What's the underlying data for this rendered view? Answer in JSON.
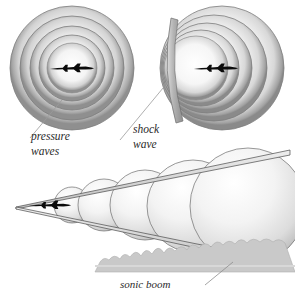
{
  "figure": {
    "background_color": "#ffffff",
    "width": 295,
    "height": 297
  },
  "labels": {
    "pressure_waves_line1": "pressure",
    "pressure_waves_line2": "waves",
    "shock_wave_line1": "shock",
    "shock_wave_line2": "wave",
    "sonic_boom": "sonic boom"
  },
  "panels": [
    {
      "name": "subsonic-panel",
      "description": "Concentric pressure wave rings around a jet",
      "center": {
        "x": 72,
        "y": 68
      },
      "ring_radii": [
        62,
        52,
        42,
        33,
        25
      ],
      "aircraft": {
        "x": 72,
        "y": 69,
        "length": 46,
        "color": "#0b0b0b"
      }
    },
    {
      "name": "sonic-panel",
      "description": "Compressed pressure rings with a shock wave front",
      "center": {
        "x": 222,
        "y": 68
      },
      "ring_radii": [
        62,
        52,
        43,
        34,
        26
      ],
      "aircraft": {
        "x": 216,
        "y": 69,
        "length": 46,
        "color": "#0b0b0b"
      },
      "shock_front": {
        "x": 170,
        "y_top": 18,
        "y_bottom": 122
      }
    },
    {
      "name": "mach-cone-panel",
      "description": "Mach cone with expanding spherical wavefronts over terrain",
      "apex": {
        "x": 16,
        "y": 207
      },
      "spheres": [
        {
          "cx": 72,
          "cy": 205,
          "r": 18
        },
        {
          "cx": 104,
          "cy": 205,
          "r": 26
        },
        {
          "cx": 145,
          "cy": 205,
          "r": 35
        },
        {
          "cx": 193,
          "cy": 206,
          "r": 46
        },
        {
          "cx": 248,
          "cy": 206,
          "r": 58
        }
      ],
      "aircraft": {
        "x": 46,
        "y": 205,
        "length": 40,
        "color": "#0b0b0b"
      },
      "ground_y": 258
    }
  ],
  "colors": {
    "ink": "#2b2b2b",
    "aircraft": "#0b0b0b",
    "ring_dark": "#9a9a9a",
    "ring_light": "#f2f2f2",
    "sphere_light": "#fbfbfb",
    "sphere_shadow": "#b8b8b8",
    "ground": "#c9c9c9",
    "leader_line": "#8d8d8d"
  }
}
